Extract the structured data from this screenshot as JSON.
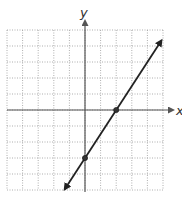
{
  "chart_data": {
    "type": "line",
    "title": "",
    "xlabel": "x",
    "ylabel": "y",
    "xlim": [
      -5,
      5
    ],
    "ylim": [
      -5,
      5
    ],
    "grid": true,
    "grid_step": 1,
    "tick_labels_shown": false,
    "series": [
      {
        "name": "line",
        "equation": "y = 1.5x - 3",
        "slope": 1.5,
        "intercept": -3,
        "x": [
          -1.3,
          4.9
        ],
        "y": [
          -4.95,
          4.35
        ],
        "arrows_both_ends": true,
        "color": "#222222"
      }
    ],
    "marked_points": [
      {
        "x": 2,
        "y": 0,
        "label": "x-intercept"
      },
      {
        "x": 0,
        "y": -3,
        "label": "y-intercept"
      }
    ]
  },
  "labels": {
    "x_axis": "x",
    "y_axis": "y"
  },
  "colors": {
    "grid": "#9a9a9a",
    "axis": "#555555",
    "line": "#222222"
  }
}
